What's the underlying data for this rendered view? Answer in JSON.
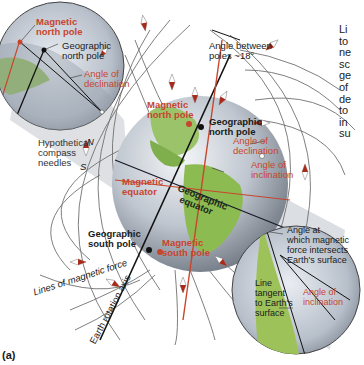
{
  "figure": {
    "panel_label": "(a)",
    "colors": {
      "background": "#ffffff",
      "red_label": "#c8452e",
      "black_label": "#1a1a1a",
      "field_line": "#6e6e6e",
      "magnetic_axis": "#c8452e",
      "rotation_axis": "#111111",
      "shadow_cone": "#c9c9c9"
    }
  },
  "inset_top_left": {
    "magnetic_north_pole": [
      "Magnetic",
      "north pole"
    ],
    "geographic_north_pole": [
      "Geographic",
      "north pole"
    ],
    "angle_of_declination": [
      "Angle of",
      "declination"
    ]
  },
  "globe_labels": {
    "angle_between_poles": [
      "Angle between",
      "poles ~18°"
    ],
    "magnetic_north_pole": [
      "Magnetic",
      "north pole"
    ],
    "geographic_north_pole": [
      "Geographic",
      "north pole"
    ],
    "angle_of_declination": [
      "Angle of",
      "declination"
    ],
    "angle_of_inclination": [
      "Angle of",
      "inclination"
    ],
    "hypothetical_compass": [
      "Hypothetical",
      "compass",
      "needles"
    ],
    "compass_n": "N",
    "compass_s": "S",
    "magnetic_equator": [
      "Magnetic",
      "equator"
    ],
    "geographic_equator": [
      "Geographic",
      "equator"
    ],
    "geographic_south_pole": [
      "Geographic",
      "south pole"
    ],
    "magnetic_south_pole": [
      "Magnetic",
      "south pole"
    ],
    "lines_of_magnetic_force": "Lines of magnetic force",
    "earth_rotation_axis": "Earth rotation axis"
  },
  "inset_bottom_right": {
    "angle_at_intersection": [
      "Angle at",
      "which magnetic",
      "force intersects",
      "Earth's surface"
    ],
    "line_tangent": [
      "Line",
      "tangent",
      "to Earth's",
      "surface"
    ],
    "angle_of_inclination": [
      "Angle of",
      "inclination"
    ]
  },
  "side_text_fragments": [
    "Li",
    "to",
    "ne",
    "sc",
    "ge",
    "of",
    "de",
    "to",
    "in",
    "su"
  ]
}
